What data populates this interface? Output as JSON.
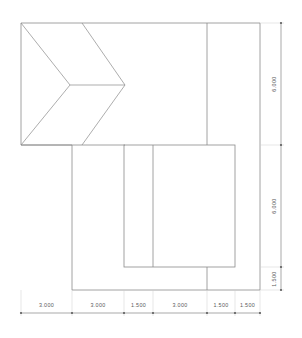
{
  "drawing": {
    "type": "architectural-plan",
    "title": "",
    "units": "meters",
    "line_color": "#8a8a8a",
    "dimension_color": "#6e6e6e",
    "label_color": "#5a5a5a",
    "background_color": "#ffffff",
    "geometry": {
      "outline_description": "L-shaped building plan with hip roof at upper left",
      "outer_points": "21,23 260,23 260,290 72,290 72,145 21,145",
      "interior_lines": [
        {
          "name": "vertical-line-upper-right",
          "x1": 207,
          "y1": 23,
          "x2": 207,
          "y2": 145
        },
        {
          "name": "vertical-line-lower-right",
          "x1": 207,
          "y1": 267,
          "x2": 207,
          "y2": 290
        },
        {
          "name": "roof-eave-bottom",
          "x1": 21,
          "y1": 145,
          "x2": 125,
          "y2": 145
        },
        {
          "name": "roof-boundary-vertical",
          "x1": 82,
          "y1": 23,
          "x2": 82,
          "y2": 23
        }
      ],
      "hip_roof": {
        "ridge": {
          "x1": 70,
          "y1": 85,
          "x2": 125,
          "y2": 85
        },
        "hips": [
          {
            "x1": 21,
            "y1": 23,
            "x2": 70,
            "y2": 85
          },
          {
            "x1": 21,
            "y1": 145,
            "x2": 70,
            "y2": 85
          },
          {
            "x1": 82,
            "y1": 23,
            "x2": 125,
            "y2": 85
          },
          {
            "x1": 82,
            "y1": 145,
            "x2": 125,
            "y2": 85
          }
        ]
      },
      "inner_rectangle": {
        "x": 124,
        "y": 145,
        "width": 111,
        "height": 122,
        "divider_x": 153
      }
    }
  },
  "dimensions": {
    "bottom": {
      "name": "horizontal-dimension-chain",
      "y_line": 313,
      "segments": [
        {
          "label": "3.000",
          "x_start": 21,
          "x_end": 72
        },
        {
          "label": "3.000",
          "x_start": 72,
          "x_end": 124
        },
        {
          "label": "1.500",
          "x_start": 124,
          "x_end": 153
        },
        {
          "label": "3.000",
          "x_start": 153,
          "x_end": 207
        },
        {
          "label": "1.500",
          "x_start": 207,
          "x_end": 235
        },
        {
          "label": "1.500",
          "x_start": 235,
          "x_end": 260
        }
      ]
    },
    "right": {
      "name": "vertical-dimension-chain",
      "x_line": 281,
      "segments": [
        {
          "label": "6.000",
          "y_start": 23,
          "y_end": 145
        },
        {
          "label": "6.000",
          "y_start": 145,
          "y_end": 267
        },
        {
          "label": "1.500",
          "y_start": 267,
          "y_end": 290
        }
      ]
    }
  }
}
